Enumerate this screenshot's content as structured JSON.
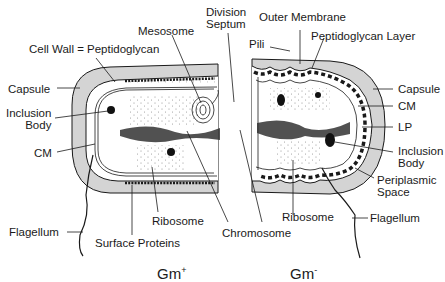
{
  "diagram": {
    "title_left": "Gm",
    "title_left_sup": "+",
    "title_right": "Gm",
    "title_right_sup": "-"
  },
  "labels": {
    "division_septum_1": "Division",
    "division_septum_2": "Septum",
    "mesosome": "Mesosome",
    "cell_wall": "Cell Wall = Peptidoglycan",
    "capsule_left": "Capsule",
    "inclusion_body_left_1": "Inclusion",
    "inclusion_body_left_2": "Body",
    "cm_left": "CM",
    "flagellum_left": "Flagellum",
    "surface_proteins": "Surface Proteins",
    "ribosome_left": "Ribosome",
    "chromosome": "Chromosome",
    "outer_membrane": "Outer Membrane",
    "pili": "Pili",
    "peptidoglycan_layer": "Peptidoglycan Layer",
    "capsule_right": "Capsule",
    "cm_right": "CM",
    "lp": "LP",
    "inclusion_body_right_1": "Inclusion",
    "inclusion_body_right_2": "Body",
    "periplasmic_space_1": "Periplasmic",
    "periplasmic_space_2": "Space",
    "ribosome_right": "Ribosome",
    "flagellum_right": "Flagellum"
  },
  "colors": {
    "capsule": "#d4d4d4",
    "line": "#1a1a1a",
    "cytoplasm": "#ffffff"
  }
}
